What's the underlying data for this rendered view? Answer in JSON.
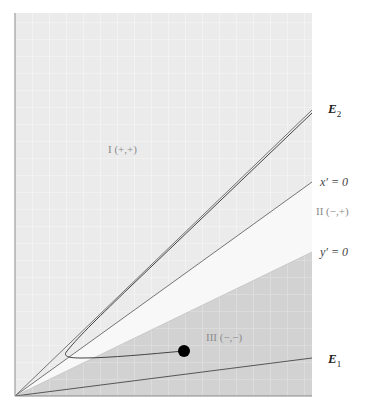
{
  "figure": {
    "type": "phase-plane-diagram",
    "regions": [
      {
        "id": "I",
        "label": "I (+,+)",
        "fill": "#ebebeb"
      },
      {
        "id": "II",
        "label": "II (−,+)",
        "fill": "#f8f8f8"
      },
      {
        "id": "III",
        "label": "III (−,−)",
        "fill": "#d3d3d3"
      }
    ],
    "lines": {
      "x_nullcline": {
        "label": "x′ = 0"
      },
      "y_nullcline": {
        "label": "y′ = 0"
      },
      "E1": {
        "label": "E",
        "subscript": "1"
      },
      "E2": {
        "label": "E",
        "subscript": "2"
      }
    },
    "trajectory": {
      "start_point": "filled-dot",
      "description": "Trajectory starting in region III, moving left, crossing region II, then approaching E2"
    },
    "colors": {
      "grid_light": "#ffffff",
      "line": "#555555",
      "dot": "#000000",
      "axis": "#777777"
    }
  }
}
